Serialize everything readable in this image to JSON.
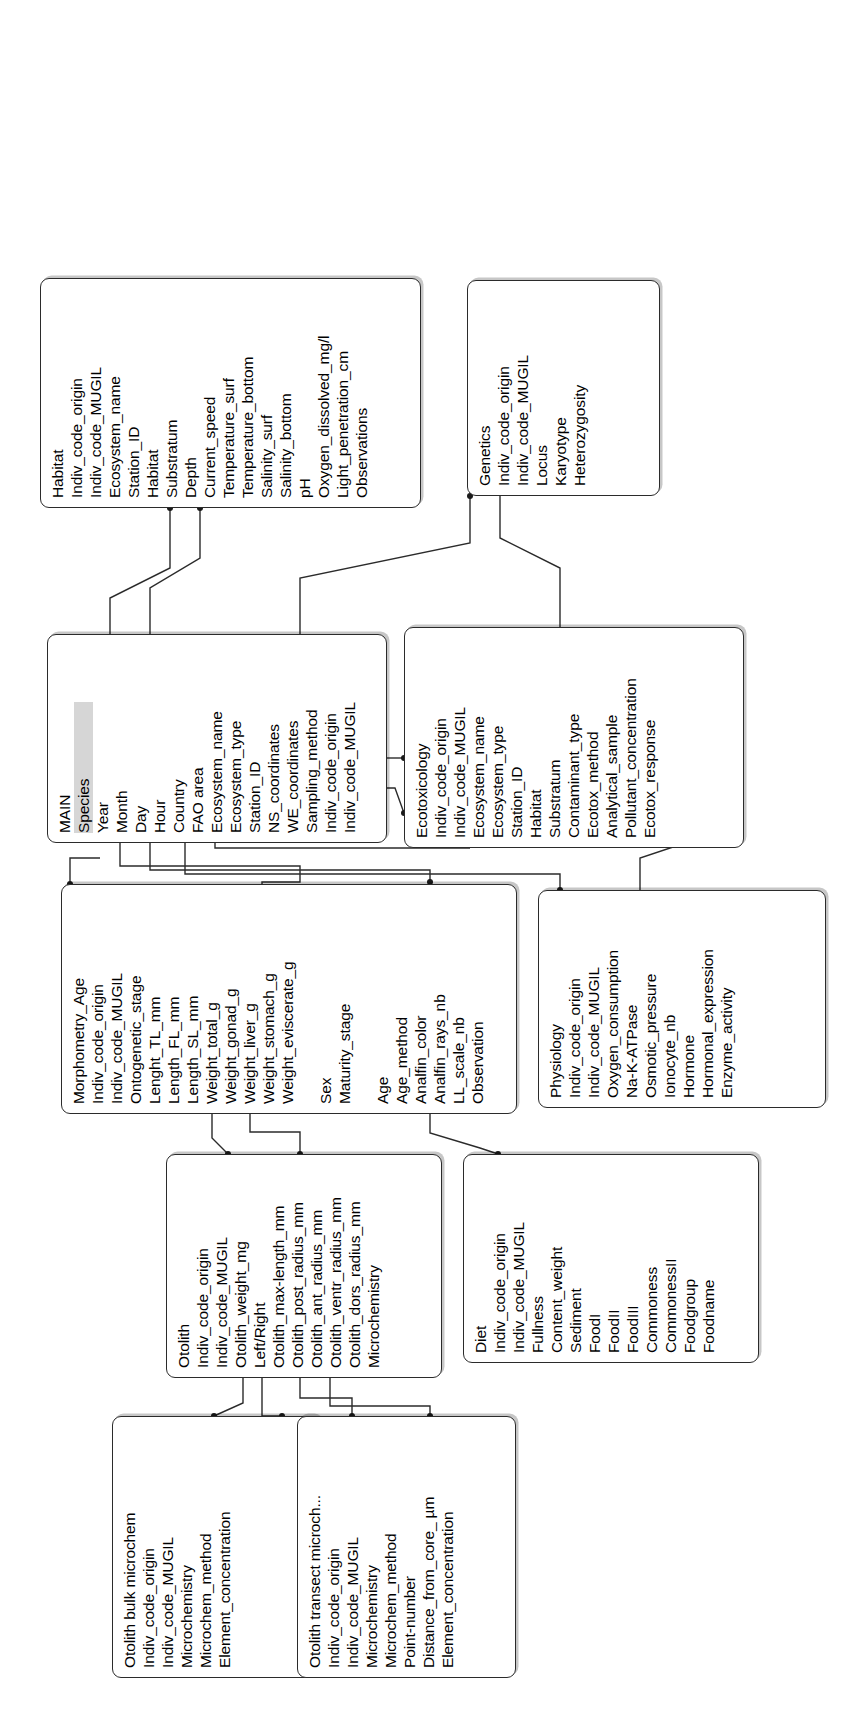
{
  "diagram": {
    "kind": "entity-relationship-schema",
    "orientation": "rotated-90-ccw",
    "accent_pk_color": "#d6d6d6",
    "line_color": "#2b2b2b"
  },
  "entities": {
    "otolith_bulk_microchem": {
      "title": "Otolith bulk microchem",
      "fields": [
        "Indiv_code_origin",
        "Indiv_code_MUGIL",
        "Microchemistry",
        "Microchem_method",
        "Element_concentration"
      ]
    },
    "otolith_transect_microchem": {
      "title": "Otolith transect microch...",
      "fields": [
        "Indiv_code_origin",
        "Indiv_code_MUGIL",
        "Microchemistry",
        "Microchem_method",
        "Point-number",
        "Distance_from_core_ µm",
        "Element_concentration"
      ]
    },
    "otolith": {
      "title": "Otolith",
      "fields": [
        "Indiv_code_origin",
        "Indiv_code_MUGIL",
        "Otolith_weight_mg",
        "Left/Right",
        "Otolith_max-length_mm",
        "Otolith_post_radius_mm",
        "Otolith_ant_radius_mm",
        "Otolith_ventr_radius_mm",
        "Otolith_dors_radius_mm",
        "Microchemistry"
      ]
    },
    "diet": {
      "title": "Diet",
      "fields": [
        "Indiv_code_origin",
        "Indiv_code_MUGIL",
        "Fullness",
        "Content_weight",
        "Sediment",
        "FoodI",
        "FoodII",
        "FoodIII",
        "Commoness",
        "CommonessII",
        "Foodgroup",
        "Foodname"
      ]
    },
    "morphometry_age": {
      "title": "Morphometry_Age",
      "fields": [
        "Indiv_code_origin",
        "Indiv_code_MUGIL",
        "Ontogenetic_stage",
        "Lenght_TL_mm",
        "Length_FL_mm",
        "Length_SL_mm",
        "Weight_total_g",
        "Weight_gonad_g",
        "Weight_liver_g",
        "Weight_stomach_g",
        "Weight_eviscerate_g",
        "",
        "Sex",
        "Maturity_stage",
        "",
        "Age",
        "Age_method",
        "Analfin_color",
        "Analfin_rays_nb",
        "LL_scale_nb",
        "Observation"
      ]
    },
    "physiology": {
      "title": "Physiology",
      "fields": [
        "Indiv_code_origin",
        "Indiv_code_MUGIL",
        "Oxygen_consumption",
        "Na-K-ATPase",
        "Osmotic_pressure",
        "Ionocyte_nb",
        "Hormone",
        "Hormonal_expression",
        "Enzyme_activity"
      ]
    },
    "main": {
      "title": "MAIN",
      "primary_key": "Species",
      "fields": [
        "Species",
        "Year",
        "Month",
        "Day",
        "Hour",
        "Country",
        "FAO area",
        "Ecosystem_name",
        "Ecosystem_type",
        "Station_ID",
        "NS_coordinates",
        "WE_coordinates",
        "Sampling_method",
        "Indiv_code_origin",
        "Indiv_code_MUGIL"
      ]
    },
    "ecotoxicology": {
      "title": "Ecotoxicology",
      "fields": [
        "Indiv_code_origin",
        "Indiv_code_MUGIL",
        "Ecosystem_name",
        "Ecosystem_type",
        "Station_ID",
        "Habitat",
        "Substratum",
        "Contaminant_type",
        "Ecotox_method",
        "Analytical_sample",
        "Pollutant_concentration",
        "Ecotox_response"
      ]
    },
    "habitat": {
      "title": "Habitat",
      "fields": [
        "Indiv_code_origin",
        "Indiv_code_MUGIL",
        "Ecosystem_name",
        "Station_ID",
        "Habitat",
        "Substratum",
        "Depth",
        "Current_speed",
        "Temperature_surf",
        "Temperature_bottom",
        "Salinity_surf",
        "Salinity_bottom",
        "pH",
        "Oxygen_dissolved_mg/l",
        "Light_penetration_cm",
        "Observations"
      ]
    },
    "genetics": {
      "title": "Genetics",
      "fields": [
        "Indiv_code_origin",
        "Indiv_code_MUGIL",
        "Locus",
        "Karyotype",
        "Heterozygosity"
      ]
    }
  },
  "relationships": [
    {
      "from": "otolith",
      "to": "otolith_bulk_microchem"
    },
    {
      "from": "otolith",
      "to": "otolith_transect_microchem"
    },
    {
      "from": "morphometry_age",
      "to": "otolith"
    },
    {
      "from": "morphometry_age",
      "to": "diet"
    },
    {
      "from": "main",
      "to": "morphometry_age"
    },
    {
      "from": "main",
      "to": "physiology"
    },
    {
      "from": "main",
      "to": "ecotoxicology"
    },
    {
      "from": "main",
      "to": "habitat"
    },
    {
      "from": "main",
      "to": "genetics"
    }
  ]
}
